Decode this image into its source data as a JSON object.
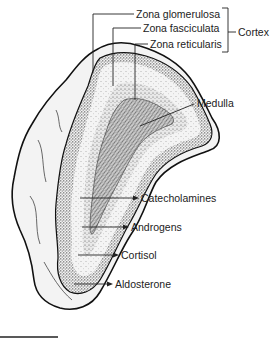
{
  "figure": {
    "labels": {
      "zona_glomerulosa": "Zona glomerulosa",
      "zona_fasciculata": "Zona fasciculata",
      "zona_reticularis": "Zona reticularis",
      "cortex": "Cortex",
      "medulla": "Medulla",
      "catecholamines": "Catecholamines",
      "androgens": "Androgens",
      "cortisol": "Cortisol",
      "aldosterone": "Aldosterone"
    }
  }
}
